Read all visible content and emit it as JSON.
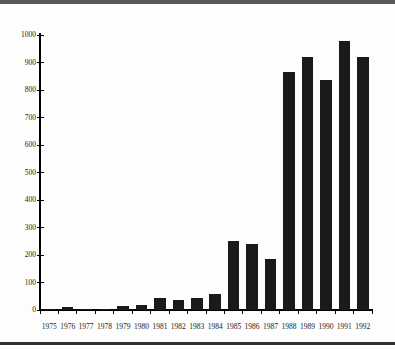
{
  "page": {
    "background": "#fdfdfd",
    "top_rule_color": "#595959",
    "bottom_rule_color": "#2d2d2d"
  },
  "chart_data": {
    "type": "bar",
    "title": "",
    "xlabel": "",
    "ylabel": "",
    "categories": [
      "1975",
      "1976",
      "1977",
      "1978",
      "1979",
      "1980",
      "1981",
      "1982",
      "1983",
      "1984",
      "1985",
      "1986",
      "1987",
      "1988",
      "1989",
      "1990",
      "1991",
      "1992"
    ],
    "values": [
      5,
      10,
      2,
      5,
      15,
      20,
      45,
      35,
      45,
      60,
      250,
      240,
      185,
      865,
      920,
      835,
      980,
      920
    ],
    "ylim": [
      0,
      1000
    ],
    "yticks": [
      0,
      100,
      200,
      300,
      400,
      500,
      600,
      700,
      800,
      900,
      1000
    ],
    "grid": false,
    "legend": false,
    "bar_color": "#1a1a1a",
    "axis_color": "#000000",
    "label_color": "#1c1c1c"
  }
}
